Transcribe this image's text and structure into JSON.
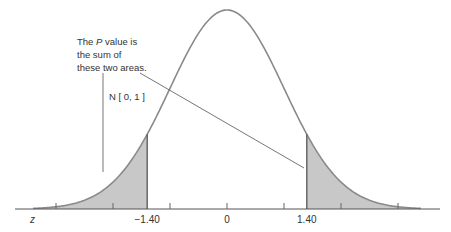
{
  "chart_data": {
    "type": "area",
    "title": "",
    "distribution": "standard normal",
    "xlabel": "z",
    "ylabel": "",
    "xlim": [
      -3.4,
      3.4
    ],
    "ticks_minor": [
      -3,
      -2,
      -1,
      1,
      2,
      3
    ],
    "tick_labels": [
      {
        "value": -1.4,
        "label": "−1.40"
      },
      {
        "value": 0,
        "label": "0"
      },
      {
        "value": 1.4,
        "label": "1.40"
      }
    ],
    "shaded_regions": [
      {
        "name": "left-tail",
        "from": -3.4,
        "to": -1.4
      },
      {
        "name": "right-tail",
        "from": 1.4,
        "to": 3.4
      }
    ],
    "curve_label": "N [ 0, 1 ]",
    "annotation": {
      "lines": [
        "The P value is",
        "the sum of",
        "these two areas."
      ],
      "italic_word": "P"
    },
    "colors": {
      "curve": "#8a8a8a",
      "shade": "#c8c8c8",
      "axis": "#555555",
      "text": "#333333"
    }
  }
}
